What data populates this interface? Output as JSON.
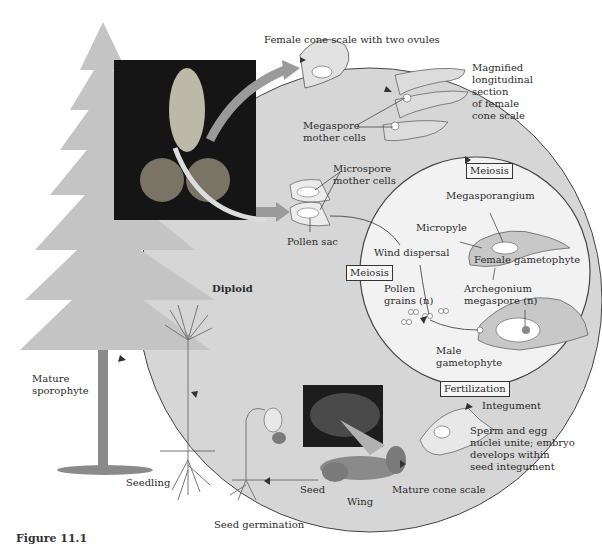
{
  "diagram": {
    "colors": {
      "cycle_fill": "#d6d6d6",
      "inset_fill": "#f2f2f2",
      "arrow": "#9a9a9a",
      "tree_foliage": "#c4c4c4",
      "trunk": "#8a8a8a",
      "photo_bg": "#151515",
      "text": "#2b2b2b"
    },
    "labels": {
      "female_cone_scale": "Female cone scale with two ovules",
      "magnified_section": [
        "Magnified",
        "longitudinal",
        "section",
        "of female",
        "cone scale"
      ],
      "megaspore_mother_cells": [
        "Megaspore",
        "mother cells"
      ],
      "microspore_mother_cells": [
        "Microspore",
        "mother cells"
      ],
      "pollen_sac": "Pollen sac",
      "meiosis_top": "Meiosis",
      "megasporangium": "Megasporangium",
      "micropyle": "Micropyle",
      "wind_dispersal": "Wind dispersal",
      "female_gametophyte": "Female gametophyte",
      "meiosis_left": "Meiosis",
      "pollen_grains": [
        "Pollen",
        "grains (n)"
      ],
      "archegonium": [
        "Archegonium",
        "megaspore (n)"
      ],
      "male_gametophyte": [
        "Male",
        "gametophyte"
      ],
      "diploid": "Diploid",
      "mature_sporophyte": [
        "Mature",
        "sporophyte"
      ],
      "fertilization": "Fertilization",
      "integument": "Integument",
      "sperm_egg": [
        "Sperm and egg",
        "nuclei unite; embryo",
        "develops within",
        "seed integument"
      ],
      "seed": "Seed",
      "wing": "Wing",
      "mature_cone_scale": "Mature cone scale",
      "seedling": "Seedling",
      "seed_germination": "Seed germination"
    },
    "caption": "Figure 11.1"
  }
}
